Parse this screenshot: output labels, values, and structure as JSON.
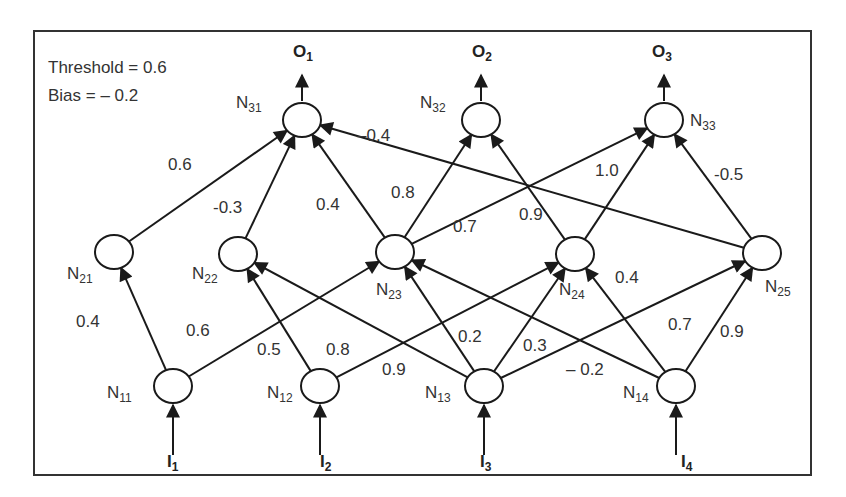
{
  "info": {
    "threshold": "Threshold = 0.6",
    "bias": "Bias = – 0.2"
  },
  "colors": {
    "stroke": "#1a1a1a",
    "text": "#333333",
    "background": "#ffffff"
  },
  "layers": {
    "input": [
      {
        "id": "N11",
        "name": "N",
        "sub": "11",
        "x": 173,
        "y": 386,
        "lx": 107,
        "ly": 398,
        "input": "I",
        "input_sub": "1",
        "ix": 167,
        "iy": 467
      },
      {
        "id": "N12",
        "name": "N",
        "sub": "12",
        "x": 320,
        "y": 386,
        "lx": 267,
        "ly": 398,
        "input": "I",
        "input_sub": "2",
        "ix": 320,
        "iy": 467
      },
      {
        "id": "N13",
        "name": "N",
        "sub": "13",
        "x": 484,
        "y": 386,
        "lx": 425,
        "ly": 398,
        "input": "I",
        "input_sub": "3",
        "ix": 480,
        "iy": 467
      },
      {
        "id": "N14",
        "name": "N",
        "sub": "14",
        "x": 676,
        "y": 386,
        "lx": 623,
        "ly": 398,
        "input": "I",
        "input_sub": "4",
        "ix": 681,
        "iy": 467
      }
    ],
    "hidden": [
      {
        "id": "N21",
        "name": "N",
        "sub": "21",
        "x": 114,
        "y": 252,
        "lx": 67,
        "ly": 279
      },
      {
        "id": "N22",
        "name": "N",
        "sub": "22",
        "x": 238,
        "y": 254,
        "lx": 192,
        "ly": 279
      },
      {
        "id": "N23",
        "name": "N",
        "sub": "23",
        "x": 395,
        "y": 252,
        "lx": 376,
        "ly": 295
      },
      {
        "id": "N24",
        "name": "N",
        "sub": "24",
        "x": 575,
        "y": 254,
        "lx": 559,
        "ly": 295
      },
      {
        "id": "N25",
        "name": "N",
        "sub": "25",
        "x": 762,
        "y": 253,
        "lx": 765,
        "ly": 292
      }
    ],
    "output": [
      {
        "id": "N31",
        "name": "N",
        "sub": "31",
        "x": 302,
        "y": 120,
        "lx": 236,
        "ly": 108,
        "output": "O",
        "output_sub": "1",
        "ox": 293,
        "oy": 57
      },
      {
        "id": "N32",
        "name": "N",
        "sub": "32",
        "x": 481,
        "y": 120,
        "lx": 420,
        "ly": 108,
        "output": "O",
        "output_sub": "2",
        "ox": 472,
        "oy": 57
      },
      {
        "id": "N33",
        "name": "N",
        "sub": "33",
        "x": 664,
        "y": 120,
        "lx": 690,
        "ly": 126,
        "output": "O",
        "output_sub": "3",
        "ox": 652,
        "oy": 57
      }
    ]
  },
  "edges": [
    {
      "from": "N11",
      "to": "N21",
      "weight": "0.4",
      "lx": 76,
      "ly": 327
    },
    {
      "from": "N11",
      "to": "N23",
      "weight": "0.6",
      "lx": 186,
      "ly": 336
    },
    {
      "from": "N12",
      "to": "N22",
      "weight": "0.5",
      "lx": 257,
      "ly": 355
    },
    {
      "from": "N12",
      "to": "N24",
      "weight": "0.8",
      "lx": 326,
      "ly": 355
    },
    {
      "from": "N13",
      "to": "N22",
      "weight": "0.9",
      "lx": 382,
      "ly": 375
    },
    {
      "from": "N13",
      "to": "N23",
      "weight": "0.2",
      "lx": 458,
      "ly": 342
    },
    {
      "from": "N13",
      "to": "N24",
      "weight": "0.3",
      "lx": 523,
      "ly": 351
    },
    {
      "from": "N13",
      "to": "N25",
      "weight": "0.7",
      "lx": 668,
      "ly": 330
    },
    {
      "from": "N14",
      "to": "N23",
      "weight": "– 0.2",
      "lx": 566,
      "ly": 375
    },
    {
      "from": "N14",
      "to": "N24",
      "weight": "0.4",
      "lx": 615,
      "ly": 283
    },
    {
      "from": "N14",
      "to": "N25",
      "weight": "0.9",
      "lx": 720,
      "ly": 337
    },
    {
      "from": "N21",
      "to": "N31",
      "weight": "0.6",
      "lx": 168,
      "ly": 170
    },
    {
      "from": "N22",
      "to": "N31",
      "weight": "-0.3",
      "lx": 213,
      "ly": 213
    },
    {
      "from": "N23",
      "to": "N31",
      "weight": "0.4",
      "lx": 316,
      "ly": 210
    },
    {
      "from": "N23",
      "to": "N32",
      "weight": "0.8",
      "lx": 391,
      "ly": 198
    },
    {
      "from": "N23",
      "to": "N33",
      "weight": "0.7",
      "lx": 453,
      "ly": 232
    },
    {
      "from": "N24",
      "to": "N32",
      "weight": "0.9",
      "lx": 519,
      "ly": 220
    },
    {
      "from": "N24",
      "to": "N33",
      "weight": "1.0",
      "lx": 595,
      "ly": 176
    },
    {
      "from": "N25",
      "to": "N31",
      "weight": "–0.4",
      "lx": 357,
      "ly": 141
    },
    {
      "from": "N25",
      "to": "N33",
      "weight": "-0.5",
      "lx": 714,
      "ly": 180
    }
  ]
}
